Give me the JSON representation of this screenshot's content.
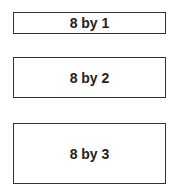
{
  "boxes": [
    {
      "label": "8 by 1",
      "rows": 1
    },
    {
      "label": "8 by 2",
      "rows": 2
    },
    {
      "label": "8 by 3",
      "rows": 3
    }
  ]
}
